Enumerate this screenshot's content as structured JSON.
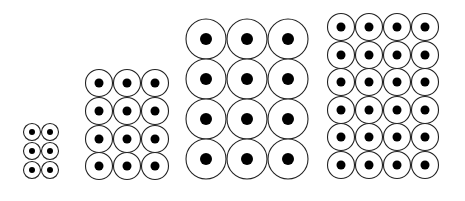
{
  "figure": {
    "background": "#ffffff",
    "stroke_color": "#222222",
    "dot_color": "#000000"
  },
  "groups": [
    {
      "id": "group-1",
      "cols": 2,
      "rows": 3,
      "circle_diameter": 18,
      "dot_diameter": 6,
      "col_centers": [
        32,
        50
      ],
      "row_centers": [
        132,
        151,
        170
      ]
    },
    {
      "id": "group-2",
      "cols": 3,
      "rows": 4,
      "circle_diameter": 28,
      "dot_diameter": 9,
      "col_centers": [
        99,
        127,
        155
      ],
      "row_centers": [
        83,
        111,
        139,
        166
      ]
    },
    {
      "id": "group-3",
      "cols": 3,
      "rows": 4,
      "circle_diameter": 41,
      "dot_diameter": 12,
      "col_centers": [
        206,
        247,
        288
      ],
      "row_centers": [
        39,
        79,
        119,
        159
      ]
    },
    {
      "id": "group-4",
      "cols": 4,
      "rows": 6,
      "circle_diameter": 28,
      "dot_diameter": 9,
      "col_centers": [
        341,
        369,
        397,
        425
      ],
      "row_centers": [
        27,
        55,
        82,
        110,
        137,
        165
      ]
    }
  ]
}
